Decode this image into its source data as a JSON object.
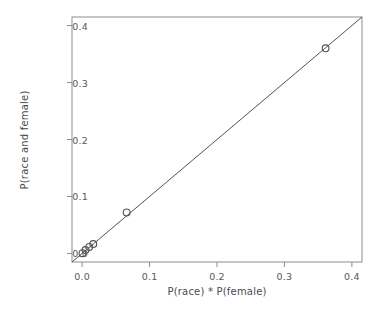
{
  "chart_data": {
    "type": "scatter",
    "title": "",
    "xlabel": "P(race) * P(female)",
    "ylabel": "P(race and female)",
    "xlim": [
      -0.015,
      0.415
    ],
    "ylim": [
      -0.015,
      0.415
    ],
    "xticks": [
      "0.0",
      "0.1",
      "0.2",
      "0.3",
      "0.4"
    ],
    "xtick_values": [
      0.0,
      0.1,
      0.2,
      0.3,
      0.4
    ],
    "yticks": [
      "0.0",
      "0.1",
      "0.2",
      "0.3",
      "0.4"
    ],
    "ytick_values": [
      0.0,
      0.1,
      0.2,
      0.3,
      0.4
    ],
    "grid": false,
    "legend": null,
    "marker": "open-circle",
    "marker_color": "#545456",
    "line_color": "#3f3f41",
    "frame_color": "#8d8d8f",
    "background": "#ffffff",
    "points": [
      {
        "x": 0.0005,
        "y": 0.0005
      },
      {
        "x": 0.005,
        "y": 0.006
      },
      {
        "x": 0.0105,
        "y": 0.0115
      },
      {
        "x": 0.0165,
        "y": 0.0165
      },
      {
        "x": 0.066,
        "y": 0.072
      },
      {
        "x": 0.361,
        "y": 0.36
      }
    ],
    "reference_line": {
      "description": "identity line y = x",
      "slope": 1,
      "intercept": 0,
      "from": [
        -0.015,
        -0.015
      ],
      "to": [
        0.415,
        0.415
      ]
    }
  },
  "axes": {
    "x_tick_labels": [
      "0.0",
      "0.1",
      "0.2",
      "0.3",
      "0.4"
    ],
    "y_tick_labels": [
      "0.0",
      "0.1",
      "0.2",
      "0.3",
      "0.4"
    ]
  }
}
